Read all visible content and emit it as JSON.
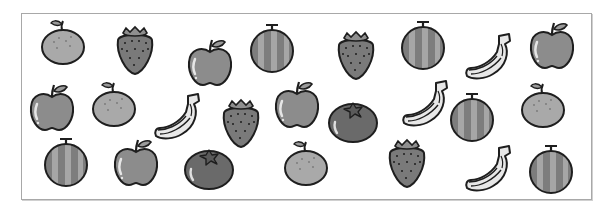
{
  "worksheet": {
    "title": "Fruit counting picture",
    "fruit_types": [
      "orange",
      "strawberry",
      "apple",
      "melon",
      "banana",
      "tomato"
    ],
    "items": [
      {
        "type": "orange",
        "x": 40,
        "y": 18
      },
      {
        "type": "strawberry",
        "x": 114,
        "y": 24
      },
      {
        "type": "apple",
        "x": 186,
        "y": 37
      },
      {
        "type": "melon",
        "x": 249,
        "y": 22
      },
      {
        "type": "strawberry",
        "x": 335,
        "y": 29
      },
      {
        "type": "melon",
        "x": 400,
        "y": 19
      },
      {
        "type": "banana",
        "x": 463,
        "y": 32
      },
      {
        "type": "apple",
        "x": 528,
        "y": 20
      },
      {
        "type": "apple",
        "x": 28,
        "y": 82
      },
      {
        "type": "orange",
        "x": 91,
        "y": 80
      },
      {
        "type": "banana",
        "x": 152,
        "y": 92
      },
      {
        "type": "strawberry",
        "x": 220,
        "y": 97
      },
      {
        "type": "apple",
        "x": 273,
        "y": 79
      },
      {
        "type": "tomato",
        "x": 327,
        "y": 98
      },
      {
        "type": "banana",
        "x": 400,
        "y": 79
      },
      {
        "type": "melon",
        "x": 449,
        "y": 91
      },
      {
        "type": "orange",
        "x": 520,
        "y": 81
      },
      {
        "type": "melon",
        "x": 43,
        "y": 136
      },
      {
        "type": "apple",
        "x": 112,
        "y": 137
      },
      {
        "type": "tomato",
        "x": 183,
        "y": 145
      },
      {
        "type": "orange",
        "x": 283,
        "y": 139
      },
      {
        "type": "strawberry",
        "x": 386,
        "y": 137
      },
      {
        "type": "banana",
        "x": 463,
        "y": 144
      },
      {
        "type": "melon",
        "x": 528,
        "y": 143
      }
    ]
  },
  "colors": {
    "outline": "#1e1e1e",
    "orange": "#a9a9a9",
    "strawberry": "#7a7a7a",
    "apple": "#8c8c8c",
    "melon_dark": "#7d7d7d",
    "melon_light": "#a6a6a6",
    "banana": "#e8e8e8",
    "tomato": "#6a6a6a",
    "leaf": "#9a9a9a",
    "frame": "#a8a8a8"
  }
}
